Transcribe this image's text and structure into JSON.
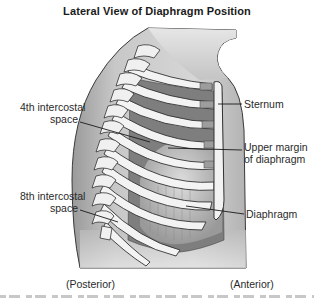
{
  "figure": {
    "title": "Lateral View of Diaphragm Position",
    "labels": {
      "fourth_intercostal_line1": "4th intercostal",
      "fourth_intercostal_line2": "space",
      "eighth_intercostal_line1": "8th intercostal",
      "eighth_intercostal_line2": "space",
      "sternum": "Sternum",
      "upper_margin_line1": "Upper margin",
      "upper_margin_line2": "of diaphragm",
      "diaphragm": "Diaphragm",
      "posterior": "(Posterior)",
      "anterior": "(Anterior)"
    },
    "colors": {
      "skin": "#c9c9c9",
      "skin_dark": "#8f8f8f",
      "bone": "#f4f4f4",
      "muscle": "#7d7d7d",
      "diaphragm": "#a9a9a9",
      "outline": "#333333"
    }
  }
}
